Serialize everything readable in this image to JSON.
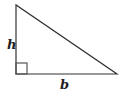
{
  "diagram": {
    "type": "right-triangle",
    "labels": {
      "height": "h",
      "base": "b"
    },
    "vertices": {
      "top": [
        16,
        5
      ],
      "bottom_left": [
        16,
        74
      ],
      "bottom_right": [
        117,
        74
      ]
    },
    "right_angle_marker": {
      "x": 16,
      "y": 63,
      "size": 11
    },
    "colors": {
      "stroke": "#333333",
      "marker": "#555555",
      "text": "#222222",
      "background": "#ffffff"
    }
  }
}
